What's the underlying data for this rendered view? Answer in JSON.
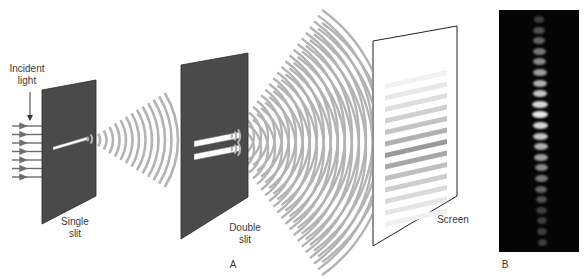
{
  "figure": {
    "panel_a": {
      "label": "A",
      "incident_light_label": [
        "Incident",
        "light"
      ],
      "single_slit_label": [
        "Single",
        "slit"
      ],
      "double_slit_label": [
        "Double",
        "slit"
      ],
      "screen_label": "Screen",
      "incident_ray_count": 7,
      "colors": {
        "slit_plate": "#4a4a4a",
        "wave": "#b0b0b0",
        "ray": "#6e6e6e",
        "fringe_dark": "#8a8a8a"
      }
    },
    "panel_b": {
      "label": "B",
      "fringe_count": 22,
      "background": "#050505"
    }
  }
}
